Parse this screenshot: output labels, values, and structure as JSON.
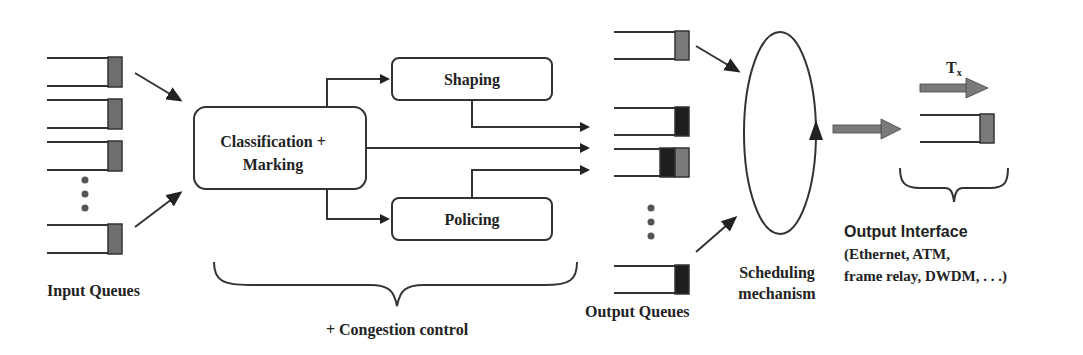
{
  "diagram": {
    "input_queues": {
      "label": "Input Queues",
      "count_visible": 4,
      "fill_color": "#6e6e6e"
    },
    "classification": {
      "line1": "Classification +",
      "line2": "Marking"
    },
    "shaping": {
      "label": "Shaping"
    },
    "policing": {
      "label": "Policing"
    },
    "congestion": {
      "label": "+ Congestion control"
    },
    "output_queues": {
      "label": "Output Queues",
      "colors": {
        "dark": "#1e1e1e",
        "gray": "#7a7a7a"
      }
    },
    "scheduler": {
      "line1": "Scheduling",
      "line2": "mechanism"
    },
    "output_interface": {
      "title": "Output Interface",
      "line1": "(Ethernet, ATM,",
      "line2": "frame relay, DWDM, . . .)",
      "tx_label": "T",
      "tx_sub": "x"
    },
    "arrow_gray": "#7a7a7a"
  }
}
